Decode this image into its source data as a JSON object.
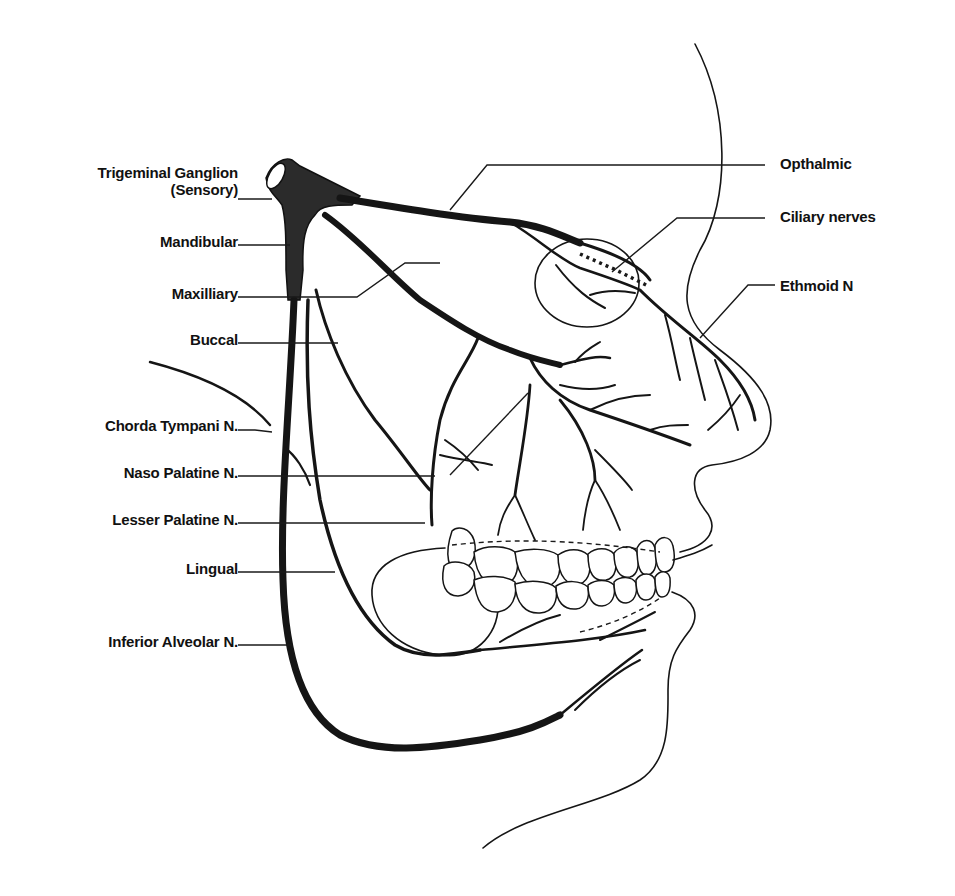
{
  "figure": {
    "colors": {
      "ink": "#151515",
      "background": "#ffffff",
      "ganglion_fill": "#2b2b2b"
    }
  },
  "labels": {
    "left": [
      {
        "id": "trigeminal_ganglion",
        "line1": "Trigeminal Ganglion",
        "line2": "(Sensory)"
      },
      {
        "id": "mandibular",
        "text": "Mandibular"
      },
      {
        "id": "maxilliary",
        "text": "Maxilliary"
      },
      {
        "id": "buccal",
        "text": "Buccal"
      },
      {
        "id": "chorda_tympani",
        "text": "Chorda Tympani N."
      },
      {
        "id": "naso_palatine",
        "text": "Naso Palatine N."
      },
      {
        "id": "lesser_palatine",
        "text": "Lesser Palatine N."
      },
      {
        "id": "lingual",
        "text": "Lingual"
      },
      {
        "id": "inferior_alveolar",
        "text": "Inferior Alveolar N."
      }
    ],
    "right": [
      {
        "id": "opthalmic",
        "text": "Opthalmic"
      },
      {
        "id": "ciliary_nerves",
        "text": "Ciliary nerves"
      },
      {
        "id": "ethmoid",
        "text": "Ethmoid N"
      }
    ]
  }
}
